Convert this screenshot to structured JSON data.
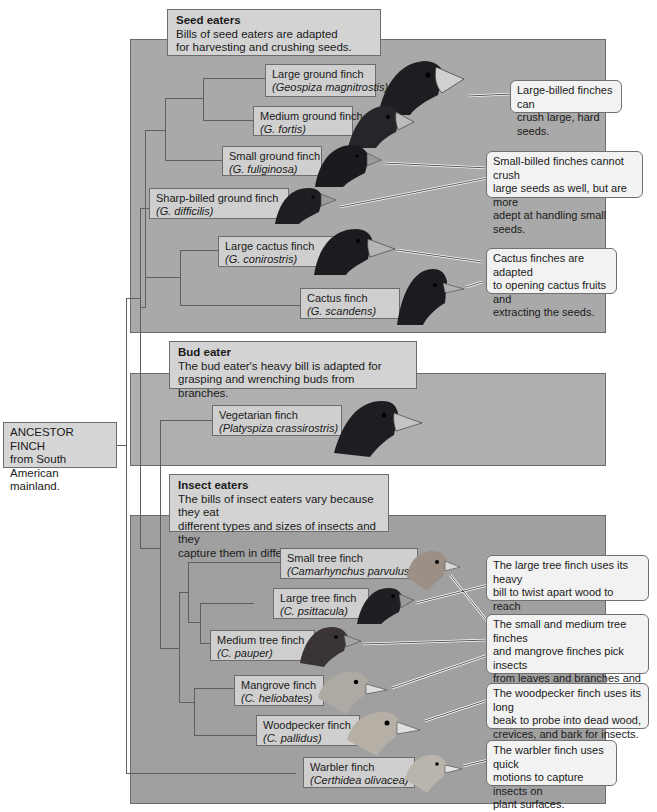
{
  "ancestor": {
    "text_line1": "ANCESTOR FINCH",
    "text_line2": "from  South American",
    "text_line3": "mainland."
  },
  "groups": {
    "seed": {
      "title": "Seed eaters",
      "desc_line1": "Bills of seed eaters are adapted",
      "desc_line2": "for harvesting and crushing seeds."
    },
    "bud": {
      "title": "Bud eater",
      "desc_line1": "The bud eater's heavy bill is adapted for",
      "desc_line2": "grasping and wrenching buds from branches."
    },
    "insect": {
      "title": "Insect eaters",
      "desc_line1": "The bills of insect eaters vary because they eat",
      "desc_line2": "different types and sizes of insects and they",
      "desc_line3": "capture them in different ways."
    }
  },
  "finches": [
    {
      "name": "Large ground finch",
      "sci": "(Geospiza magnitrostis)"
    },
    {
      "name": "Medium ground finch",
      "sci": "(G. fortis)"
    },
    {
      "name": "Small ground finch",
      "sci": "(G. fuliginosa)"
    },
    {
      "name": "Sharp-billed ground finch",
      "sci": "(G. difficilis)"
    },
    {
      "name": "Large cactus finch",
      "sci": "(G. conirostris)"
    },
    {
      "name": "Cactus finch",
      "sci": "(G. scandens)"
    },
    {
      "name": "Vegetarian finch",
      "sci": "(Platyspiza crassirostris)"
    },
    {
      "name": "Small tree finch",
      "sci": "(Camarhynchus parvulus)"
    },
    {
      "name": "Large tree finch",
      "sci": "(C. psittacula)"
    },
    {
      "name": "Medium tree finch",
      "sci": "(C. pauper)"
    },
    {
      "name": "Mangrove finch",
      "sci": "(C. heliobates)"
    },
    {
      "name": "Woodpecker finch",
      "sci": "(C. pallidus)"
    },
    {
      "name": "Warbler finch",
      "sci": "(Certhidea olivacea)"
    }
  ],
  "callouts": [
    {
      "l1": "Large-billed finches can",
      "l2": "crush large, hard seeds.",
      "l3": ""
    },
    {
      "l1": "Small-billed finches cannot crush",
      "l2": "large seeds as well, but are more",
      "l3": "adept at handling small seeds."
    },
    {
      "l1": "Cactus finches are adapted",
      "l2": "to opening cactus fruits and",
      "l3": "extracting the seeds."
    },
    {
      "l1": "The large tree finch uses its heavy",
      "l2": "bill to twist apart wood to reach",
      "l3": "larvae inside."
    },
    {
      "l1": "The small and medium tree finches",
      "l2": "and mangrove finches pick insects",
      "l3": "from leaves and branches and",
      "l4": "explore crevices for hidden prey."
    },
    {
      "l1": "The woodpecker finch uses its long",
      "l2": "beak to probe into dead wood,",
      "l3": "crevices, and bark for insects."
    },
    {
      "l1": "The warbler finch uses quick",
      "l2": "motions to capture insects on",
      "l3": "plant surfaces."
    }
  ],
  "colors": {
    "panel_fill": "#a9a9a9",
    "header_fill": "#d3d3d3",
    "label_fill": "#cfcfcf",
    "callout_fill": "#f2f2f2",
    "dark_bird": "#1e1e22",
    "light_bird": "#b8b8b0",
    "beak": "#cfcfcf"
  }
}
